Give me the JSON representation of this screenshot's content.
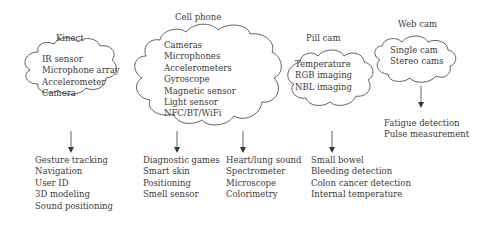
{
  "diagram": {
    "groups": [
      {
        "id": "kinect",
        "title": "Kinect",
        "sensors": [
          "IR sensor",
          "Microphone array",
          "Accelerometer",
          "Camera"
        ],
        "applications": [
          [
            "Gesture tracking",
            "Navigation",
            "User ID",
            "3D modeling",
            "Sound positioning"
          ]
        ]
      },
      {
        "id": "cell-phone",
        "title": "Cell phone",
        "sensors": [
          "Cameras",
          "Microphones",
          "Accelerometers",
          "Gyroscope",
          "Magnetic sensor",
          "Light sensor",
          "NFC/BT/WiFi"
        ],
        "applications": [
          [
            "Diagnostic games",
            "Smart skin",
            "Positioning",
            "Smell sensor"
          ],
          [
            "Heart/lung sound",
            "Spectrometer",
            "Microscope",
            "Colorimetry"
          ]
        ]
      },
      {
        "id": "pill-cam",
        "title": "Pill cam",
        "sensors": [
          "Temperature",
          "RGB imaging",
          "NBL imaging"
        ],
        "applications": [
          [
            "Small bowel",
            "Bleeding detection",
            "Colon cancer detection",
            "Internal temperature"
          ]
        ]
      },
      {
        "id": "web-cam",
        "title": "Web cam",
        "sensors": [
          "Single cam",
          "Stereo cams"
        ],
        "applications": [
          [
            "Fatigue detection",
            "Pulse measurement"
          ]
        ]
      }
    ],
    "colors": {
      "line": "#3a3a3a",
      "text": "#3a3a3a",
      "background": "#ffffff"
    }
  }
}
